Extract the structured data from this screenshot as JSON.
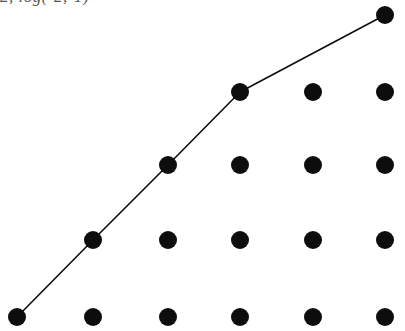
{
  "figure": {
    "width": 405,
    "height": 331,
    "background_color": "#ffffff",
    "ink_color": "#0d0d0d",
    "caption": "2, log(-2,-1)",
    "caption_color": "#5a5a5a"
  },
  "chart_data": {
    "type": "scatter",
    "title": "",
    "subtitle": "",
    "xlabel": "",
    "ylabel": "",
    "grid": false,
    "legend": null,
    "axes_visible": false,
    "tick_labels_x": [],
    "tick_labels_y": [],
    "xlim": [
      0,
      5
    ],
    "ylim": [
      0,
      4
    ],
    "marker": {
      "shape": "circle",
      "color": "#0d0d0d",
      "radius_px": 9,
      "diameter_px": 18
    },
    "line": {
      "name": "lattice path",
      "color": "#0d0d0d",
      "width_px": 1.6,
      "style": "solid"
    },
    "column_x_px": [
      17,
      93,
      168,
      240,
      313,
      385
    ],
    "row_y_px": [
      15,
      92,
      165,
      240,
      317
    ],
    "column_counts": [
      1,
      2,
      3,
      4,
      4,
      5
    ],
    "points_px": [
      {
        "x": 17,
        "y": 317,
        "col": 0,
        "row": 4,
        "on_path": true
      },
      {
        "x": 93,
        "y": 240,
        "col": 1,
        "row": 3,
        "on_path": true
      },
      {
        "x": 93,
        "y": 317,
        "col": 1,
        "row": 4,
        "on_path": false
      },
      {
        "x": 168,
        "y": 165,
        "col": 2,
        "row": 2,
        "on_path": true
      },
      {
        "x": 168,
        "y": 240,
        "col": 2,
        "row": 3,
        "on_path": false
      },
      {
        "x": 168,
        "y": 317,
        "col": 2,
        "row": 4,
        "on_path": false
      },
      {
        "x": 240,
        "y": 92,
        "col": 3,
        "row": 1,
        "on_path": true
      },
      {
        "x": 240,
        "y": 165,
        "col": 3,
        "row": 2,
        "on_path": false
      },
      {
        "x": 240,
        "y": 240,
        "col": 3,
        "row": 3,
        "on_path": false
      },
      {
        "x": 240,
        "y": 317,
        "col": 3,
        "row": 4,
        "on_path": false
      },
      {
        "x": 313,
        "y": 92,
        "col": 4,
        "row": 1,
        "on_path": false
      },
      {
        "x": 313,
        "y": 165,
        "col": 4,
        "row": 2,
        "on_path": false
      },
      {
        "x": 313,
        "y": 240,
        "col": 4,
        "row": 3,
        "on_path": false
      },
      {
        "x": 313,
        "y": 317,
        "col": 4,
        "row": 4,
        "on_path": false
      },
      {
        "x": 385,
        "y": 15,
        "col": 5,
        "row": 0,
        "on_path": true
      },
      {
        "x": 385,
        "y": 92,
        "col": 5,
        "row": 1,
        "on_path": false
      },
      {
        "x": 385,
        "y": 165,
        "col": 5,
        "row": 2,
        "on_path": false
      },
      {
        "x": 385,
        "y": 240,
        "col": 5,
        "row": 3,
        "on_path": false
      },
      {
        "x": 385,
        "y": 317,
        "col": 5,
        "row": 4,
        "on_path": false
      }
    ],
    "path_px": [
      {
        "x": 17,
        "y": 317
      },
      {
        "x": 93,
        "y": 240
      },
      {
        "x": 168,
        "y": 165
      },
      {
        "x": 240,
        "y": 92
      },
      {
        "x": 385,
        "y": 15
      }
    ]
  }
}
